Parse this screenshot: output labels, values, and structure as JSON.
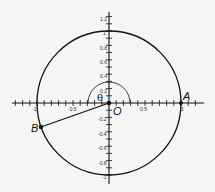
{
  "diagram": {
    "type": "unit-circle",
    "origin_label": "O",
    "points": [
      {
        "label": "A",
        "x": 1,
        "y": 0
      },
      {
        "label": "B",
        "x": -0.94,
        "y": -0.34
      }
    ],
    "angle_label": "θ",
    "x_tick_labels": [
      "-1",
      "-0.5",
      "0.5",
      "1"
    ],
    "y_tick_labels": [
      "1.2",
      "1",
      "0.8",
      "0.6",
      "0.4",
      "0.2",
      "-0.2",
      "-0.4",
      "-0.6",
      "-0.8",
      "-1"
    ],
    "colors": {
      "line": "#111111",
      "background": "#f5f5f5"
    }
  }
}
